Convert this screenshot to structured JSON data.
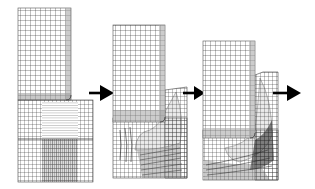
{
  "figure": {
    "background": "#ffffff",
    "mesh_color": "#1a1a1a",
    "shade_color": "#9a9a9a",
    "arrow_color": "#000000",
    "stages": [
      {
        "id": "stage-1",
        "label": "Initial mesh",
        "punch": {
          "x": 18,
          "y": 8,
          "w": 53,
          "h": 92
        },
        "block": {
          "x": 18,
          "y": 100,
          "w": 75,
          "h": 82
        }
      },
      {
        "id": "stage-2",
        "label": "Intermediate deformation",
        "punch": {
          "x": 113,
          "y": 25,
          "w": 52,
          "h": 97
        },
        "block": {
          "x": 113,
          "y": 85,
          "w": 74,
          "h": 93
        }
      },
      {
        "id": "stage-3",
        "label": "Final deformation",
        "punch": {
          "x": 203,
          "y": 41,
          "w": 52,
          "h": 97
        },
        "block": {
          "x": 203,
          "y": 70,
          "w": 75,
          "h": 110
        }
      }
    ],
    "arrows": [
      {
        "id": "arrow-1",
        "x1": 89,
        "x2": 114,
        "y": 93
      },
      {
        "id": "arrow-2",
        "x1": 183,
        "x2": 205,
        "y": 93
      },
      {
        "id": "arrow-3",
        "x1": 273,
        "x2": 301,
        "y": 93
      }
    ]
  }
}
